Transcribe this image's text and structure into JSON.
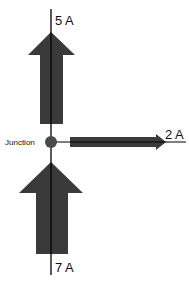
{
  "diagram": {
    "junction_label": "Junction",
    "currents": [
      {
        "id": "top",
        "label": "5 A",
        "direction": "up",
        "role": "out"
      },
      {
        "id": "right",
        "label": "2 A",
        "direction": "right",
        "role": "out"
      },
      {
        "id": "bottom",
        "label": "7 A",
        "direction": "up",
        "role": "in"
      }
    ],
    "colors": {
      "arrow": "#3a3a3a",
      "wire": "#000000",
      "junction": "#4a4a4a",
      "background": "#ffffff"
    }
  }
}
